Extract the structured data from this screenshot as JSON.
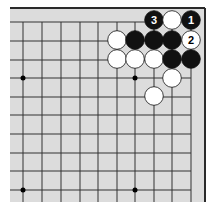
{
  "diagram": {
    "type": "go-board-diagram",
    "region": "top-right corner",
    "colors": {
      "board": "#dcdcdc",
      "line": "#333333",
      "border": "#2a2a2a",
      "black_stone": "#111111",
      "white_stone": "#ffffff"
    },
    "grid": {
      "x": [
        23,
        42,
        61,
        80,
        98,
        117,
        135,
        154,
        172,
        191
      ],
      "y": [
        22,
        41,
        60,
        78,
        97,
        115,
        134,
        153,
        171,
        190
      ]
    },
    "star_points": [
      {
        "x": 23,
        "y": 78
      },
      {
        "x": 135,
        "y": 78
      },
      {
        "x": 23,
        "y": 190
      },
      {
        "x": 135,
        "y": 190
      }
    ],
    "stones": [
      {
        "color": "black",
        "x": 154,
        "y": 20,
        "label": "3"
      },
      {
        "color": "white",
        "x": 172,
        "y": 20,
        "label": ""
      },
      {
        "color": "black",
        "x": 191,
        "y": 20,
        "label": "1"
      },
      {
        "color": "white",
        "x": 117,
        "y": 40,
        "label": ""
      },
      {
        "color": "black",
        "x": 135,
        "y": 40,
        "label": ""
      },
      {
        "color": "black",
        "x": 154,
        "y": 40,
        "label": ""
      },
      {
        "color": "black",
        "x": 172,
        "y": 40,
        "label": ""
      },
      {
        "color": "white",
        "x": 191,
        "y": 40,
        "label": "2"
      },
      {
        "color": "white",
        "x": 117,
        "y": 59,
        "label": ""
      },
      {
        "color": "white",
        "x": 135,
        "y": 59,
        "label": ""
      },
      {
        "color": "white",
        "x": 154,
        "y": 59,
        "label": ""
      },
      {
        "color": "black",
        "x": 172,
        "y": 59,
        "label": ""
      },
      {
        "color": "black",
        "x": 191,
        "y": 59,
        "label": ""
      },
      {
        "color": "white",
        "x": 172,
        "y": 78,
        "label": ""
      },
      {
        "color": "white",
        "x": 154,
        "y": 96,
        "label": ""
      }
    ]
  }
}
